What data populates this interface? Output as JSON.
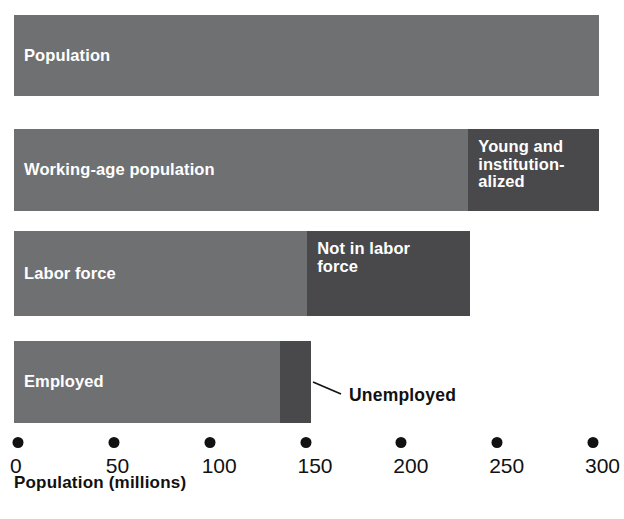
{
  "chart_data": {
    "type": "bar",
    "orientation": "horizontal",
    "title": "",
    "subtitle": "",
    "xlabel": "Population (millions)",
    "ylabel": "",
    "xlim": [
      0,
      310
    ],
    "xticks": [
      0,
      50,
      100,
      150,
      200,
      250,
      300
    ],
    "xtick_labels": [
      "0",
      "50",
      "100",
      "150",
      "200",
      "250",
      "300"
    ],
    "grid": false,
    "legend": "none",
    "stacked": true,
    "colors": {
      "primary_segment": "#6f7072",
      "secondary_segment": "#49494b",
      "segment_text": "#ffffff",
      "axis_text": "#111111",
      "background": "#ffffff"
    },
    "categories": [
      "Population",
      "Working-age population",
      "Labor force",
      "Employed"
    ],
    "bars": [
      {
        "name": "population-bar",
        "segments": [
          {
            "label": "Population",
            "start": 0,
            "value": 305,
            "tone": "light",
            "label_style": "mid"
          }
        ]
      },
      {
        "name": "working-age-bar",
        "segments": [
          {
            "label": "Working-age population",
            "start": 0,
            "value": 237,
            "tone": "light",
            "label_style": "mid"
          },
          {
            "label": "Young and\ninstitution-\nalized",
            "start": 237,
            "value": 68,
            "tone": "dark",
            "label_style": "block"
          }
        ]
      },
      {
        "name": "labor-force-bar",
        "segments": [
          {
            "label": "Labor force",
            "start": 0,
            "value": 153,
            "tone": "light",
            "label_style": "mid"
          },
          {
            "label": "Not in labor\nforce",
            "start": 153,
            "value": 85,
            "tone": "dark",
            "label_style": "block"
          }
        ]
      },
      {
        "name": "employed-bar",
        "segments": [
          {
            "label": "Employed",
            "start": 0,
            "value": 139,
            "tone": "light",
            "label_style": "mid"
          },
          {
            "label": "",
            "start": 139,
            "value": 16,
            "tone": "dark",
            "label_style": "mid"
          }
        ]
      }
    ],
    "annotations": [
      {
        "name": "unemployed-callout",
        "text": "Unemployed",
        "points_to": "employed-bar.segment.1"
      }
    ]
  },
  "axis": {
    "title": "Population (millions)",
    "ticks": [
      {
        "value": 0,
        "label": "0"
      },
      {
        "value": 50,
        "label": "50"
      },
      {
        "value": 100,
        "label": "100"
      },
      {
        "value": 150,
        "label": "150"
      },
      {
        "value": 200,
        "label": "200"
      },
      {
        "value": 250,
        "label": "250"
      },
      {
        "value": 300,
        "label": "300"
      }
    ]
  },
  "callout": {
    "unemployed_label": "Unemployed"
  }
}
